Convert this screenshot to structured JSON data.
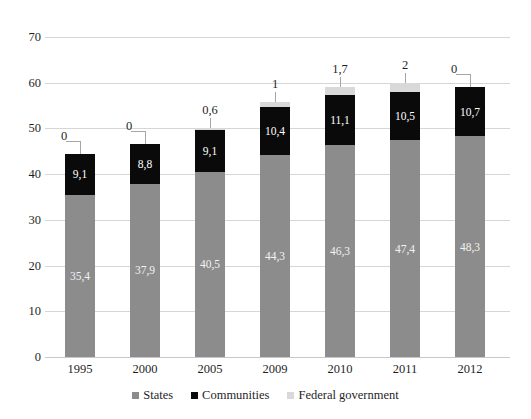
{
  "chart_data": {
    "type": "bar",
    "subtype": "stacked-bar",
    "title": "",
    "xlabel": "",
    "ylabel": "",
    "ylim": [
      0,
      70
    ],
    "ytick_step": 10,
    "yticks": [
      "70",
      "60",
      "50",
      "40",
      "30",
      "20",
      "10",
      "0"
    ],
    "grid": true,
    "legend_position": "bottom",
    "categories": [
      "1995",
      "2000",
      "2005",
      "2009",
      "2010",
      "2011",
      "2012"
    ],
    "series": [
      {
        "name": "States",
        "color": "#8c8c8c",
        "values": [
          35.4,
          37.9,
          40.5,
          44.3,
          46.3,
          47.4,
          48.3
        ],
        "labels": [
          "35,4",
          "37,9",
          "40,5",
          "44,3",
          "46,3",
          "47,4",
          "48,3"
        ]
      },
      {
        "name": "Communities",
        "color": "#0a0a0a",
        "values": [
          9.1,
          8.8,
          9.1,
          10.4,
          11.1,
          10.5,
          10.7
        ],
        "labels": [
          "9,1",
          "8,8",
          "9,1",
          "10,4",
          "11,1",
          "10,5",
          "10,7"
        ]
      },
      {
        "name": "Federal government",
        "color": "#d9d9d9",
        "values": [
          0,
          0,
          0.6,
          1,
          1.7,
          2,
          0
        ],
        "labels": [
          "0",
          "0",
          "0,6",
          "1",
          "1,7",
          "2",
          "0"
        ]
      }
    ],
    "totals": [
      44.5,
      46.7,
      50.2,
      55.7,
      59.1,
      59.9,
      59.0
    ]
  },
  "legend": {
    "items": [
      {
        "label": "States",
        "color": "#8c8c8c"
      },
      {
        "label": "Communities",
        "color": "#0a0a0a"
      },
      {
        "label": "Federal government",
        "color": "#d9d9d9"
      }
    ]
  }
}
